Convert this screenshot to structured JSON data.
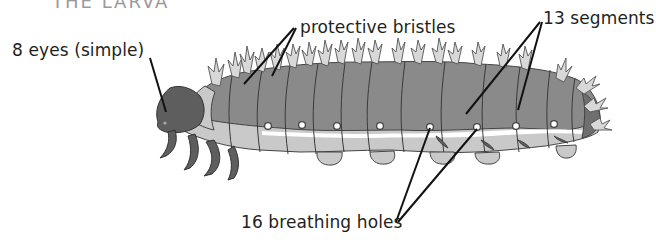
{
  "diagram": {
    "title_partial": "THE LARVA",
    "labels": {
      "eyes": "8 eyes (simple)",
      "bristles": "protective bristles",
      "segments": "13 segments",
      "breathing": "16 breathing holes"
    },
    "colors": {
      "background": "#ffffff",
      "dorsal": "#8a8a8a",
      "ventral": "#c9c9c9",
      "head_and_legs": "#5e5e5e",
      "stripe": "#ffffff",
      "bristle": "#d8d8d8",
      "outline": "#444444",
      "leader_line": "#111111",
      "text": "#231f20"
    },
    "spiracles_x": [
      268,
      302,
      337,
      380,
      430,
      477,
      516,
      554
    ],
    "segment_count": 13,
    "eye_count": 8,
    "breathing_hole_count": 16
  }
}
